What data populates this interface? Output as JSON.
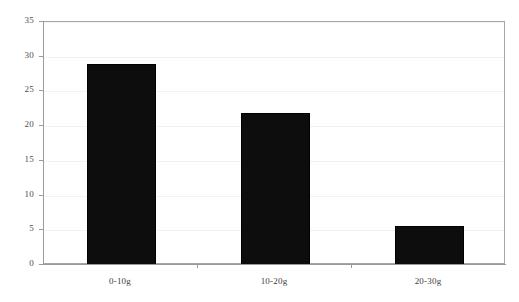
{
  "chart_data": {
    "type": "bar",
    "title": "",
    "subtitle": "",
    "xlabel": "",
    "ylabel": "",
    "categories": [
      "0-10g",
      "10-20g",
      "20-30g"
    ],
    "values": [
      29.0,
      21.9,
      5.6
    ],
    "series": [
      {
        "name": "",
        "values": [
          29.0,
          21.9,
          5.6
        ],
        "color": "#0d0d0d"
      }
    ],
    "ylim": [
      0,
      35
    ],
    "ytick_labels": [
      "0",
      "5",
      "10",
      "15",
      "20",
      "25",
      "30",
      "35"
    ],
    "ytick_values": [
      0,
      5,
      10,
      15,
      20,
      25,
      30,
      35
    ],
    "grid": true,
    "grid_axis": "y",
    "legend": false,
    "legend_position": "none",
    "bar_color": "#0d0d0d",
    "plot_background": "#ffffff",
    "frame_color": "#a6a6a6",
    "annotations": []
  },
  "figure": {
    "background": "#ffffff",
    "width": 519,
    "height": 302
  }
}
